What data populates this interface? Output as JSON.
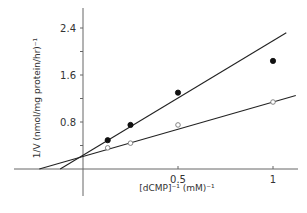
{
  "chart_data": {
    "type": "line",
    "title": "",
    "xlabel": "[dCMP]⁻¹ (mM)⁻¹",
    "ylabel": "1/V (nmol/mg protein/hr)⁻¹",
    "xlim": [
      -0.24,
      1.13
    ],
    "ylim": [
      -0.45,
      2.75
    ],
    "grid": false,
    "legend": null,
    "x_ticks": [
      {
        "value": 0.5,
        "label": "0.5"
      },
      {
        "value": 1,
        "label": "1"
      }
    ],
    "y_ticks": [
      {
        "value": 0.4,
        "label": ""
      },
      {
        "value": 0.8,
        "label": "0.8"
      },
      {
        "value": 1.2,
        "label": ""
      },
      {
        "value": 1.6,
        "label": "1.6"
      },
      {
        "value": 2.0,
        "label": ""
      },
      {
        "value": 2.4,
        "label": "2.4"
      }
    ],
    "series": [
      {
        "name": "filled circles",
        "marker": "filled-circle",
        "x": [
          0.13,
          0.25,
          0.5,
          1.0
        ],
        "y": [
          0.49,
          0.75,
          1.3,
          1.84
        ],
        "fit_line": {
          "x": [
            -0.12,
            1.07
          ],
          "y": [
            0.0,
            2.32
          ]
        }
      },
      {
        "name": "open circles",
        "marker": "open-circle",
        "x": [
          0.13,
          0.25,
          0.5,
          1.0
        ],
        "y": [
          0.36,
          0.44,
          0.75,
          1.14
        ],
        "fit_line": {
          "x": [
            -0.23,
            1.12
          ],
          "y": [
            0.0,
            1.25
          ]
        }
      }
    ]
  }
}
